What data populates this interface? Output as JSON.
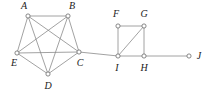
{
  "figure": {
    "background_color": "#ffffff",
    "edge_color": "#8a8a8a",
    "vertex_fill_color": "#ffffff",
    "vertex_stroke_color": "#6b6b6b",
    "label_color": "#1a1a1a"
  },
  "chart_data": {
    "type": "diagram",
    "diagram_kind": "undirected-graph",
    "title": "",
    "vertex_count": 10,
    "edge_count": 16,
    "vertices": [
      {
        "id": "A",
        "label": "A",
        "x": 28,
        "y": 16,
        "label_x": 24,
        "label_y": 7
      },
      {
        "id": "B",
        "label": "B",
        "x": 68,
        "y": 16,
        "label_x": 72,
        "label_y": 7
      },
      {
        "id": "C",
        "label": "C",
        "x": 79,
        "y": 52,
        "label_x": 80,
        "label_y": 64
      },
      {
        "id": "D",
        "label": "D",
        "x": 48,
        "y": 74,
        "label_x": 48,
        "label_y": 87
      },
      {
        "id": "E",
        "label": "E",
        "x": 17,
        "y": 53,
        "label_x": 14,
        "label_y": 64
      },
      {
        "id": "F",
        "label": "F",
        "x": 118,
        "y": 26,
        "label_x": 116,
        "label_y": 15
      },
      {
        "id": "G",
        "label": "G",
        "x": 144,
        "y": 26,
        "label_x": 144,
        "label_y": 15
      },
      {
        "id": "H",
        "label": "H",
        "x": 144,
        "y": 56,
        "label_x": 144,
        "label_y": 69
      },
      {
        "id": "I",
        "label": "I",
        "x": 118,
        "y": 56,
        "label_x": 117,
        "label_y": 69
      },
      {
        "id": "J",
        "label": "J",
        "x": 189,
        "y": 56,
        "label_x": 199,
        "label_y": 57
      }
    ],
    "edges": [
      {
        "from": "A",
        "to": "B"
      },
      {
        "from": "A",
        "to": "C"
      },
      {
        "from": "A",
        "to": "D"
      },
      {
        "from": "A",
        "to": "E"
      },
      {
        "from": "B",
        "to": "C"
      },
      {
        "from": "B",
        "to": "D"
      },
      {
        "from": "B",
        "to": "E"
      },
      {
        "from": "C",
        "to": "D"
      },
      {
        "from": "C",
        "to": "E"
      },
      {
        "from": "D",
        "to": "E"
      },
      {
        "from": "C",
        "to": "I"
      },
      {
        "from": "F",
        "to": "G"
      },
      {
        "from": "F",
        "to": "I"
      },
      {
        "from": "G",
        "to": "H"
      },
      {
        "from": "G",
        "to": "I"
      },
      {
        "from": "I",
        "to": "H"
      },
      {
        "from": "H",
        "to": "J"
      }
    ],
    "components": [
      {
        "name": "left-clique",
        "vertices": [
          "A",
          "B",
          "C",
          "D",
          "E"
        ],
        "note": "complete graph K5"
      },
      {
        "name": "right-cluster",
        "vertices": [
          "F",
          "G",
          "H",
          "I",
          "J"
        ],
        "note": "quadrilateral FGHI with diagonal IG, plus pendant J on H"
      }
    ],
    "vertex_radius": 2.1
  }
}
